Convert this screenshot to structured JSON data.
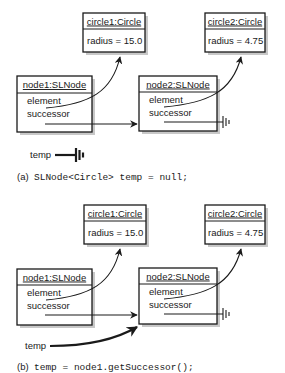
{
  "panels": [
    {
      "id": "a",
      "circle1": {
        "title": "circle1:Circle",
        "attr": "radius = 15.0"
      },
      "circle2": {
        "title": "circle2:Circle",
        "attr": "radius = 4.75"
      },
      "node1": {
        "title": "node1:SLNode",
        "field1": "element",
        "field2": "successor"
      },
      "node2": {
        "title": "node2:SLNode",
        "field1": "element",
        "field2": "successor"
      },
      "temp_label": "temp",
      "temp_value": "null",
      "caption_label": "(a)",
      "caption_code": "SLNode<Circle> temp = null;"
    },
    {
      "id": "b",
      "circle1": {
        "title": "circle1:Circle",
        "attr": "radius = 15.0"
      },
      "circle2": {
        "title": "circle2:Circle",
        "attr": "radius = 4.75"
      },
      "node1": {
        "title": "node1:SLNode",
        "field1": "element",
        "field2": "successor"
      },
      "node2": {
        "title": "node2:SLNode",
        "field1": "element",
        "field2": "successor"
      },
      "temp_label": "temp",
      "temp_value": "node2",
      "caption_label": "(b)",
      "caption_code": "temp = node1.getSuccessor();"
    }
  ]
}
